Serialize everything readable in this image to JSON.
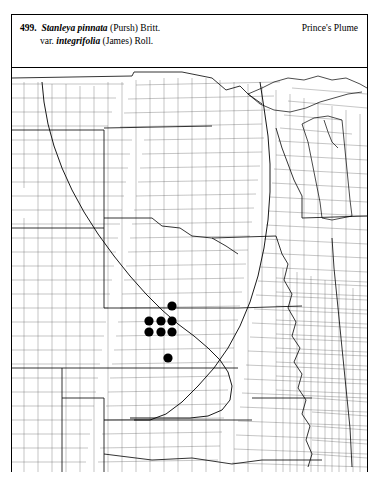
{
  "plate": {
    "entry_number": "499.",
    "genus_species": "Stanleya pinnata",
    "species_authority": "(Pursh) Britt.",
    "variety_prefix": "var.",
    "variety_epithet": "integrifolia",
    "variety_authority": "(James) Roll.",
    "common_name": "Prince's Plume"
  },
  "map": {
    "region": "central-and-western-united-states",
    "boundary_style": "county-level",
    "dot_symbol": "filled-circle",
    "dot_diameter_px": 9,
    "dot_count": 8,
    "occurrence_dots": [
      {
        "id": "dot-1",
        "x": 171,
        "y": 305
      },
      {
        "id": "dot-2",
        "x": 148,
        "y": 320
      },
      {
        "id": "dot-3",
        "x": 160,
        "y": 320
      },
      {
        "id": "dot-4",
        "x": 171,
        "y": 320
      },
      {
        "id": "dot-5",
        "x": 148,
        "y": 331
      },
      {
        "id": "dot-6",
        "x": 160,
        "y": 331
      },
      {
        "id": "dot-7",
        "x": 171,
        "y": 331
      },
      {
        "id": "dot-8",
        "x": 167,
        "y": 357
      }
    ]
  }
}
